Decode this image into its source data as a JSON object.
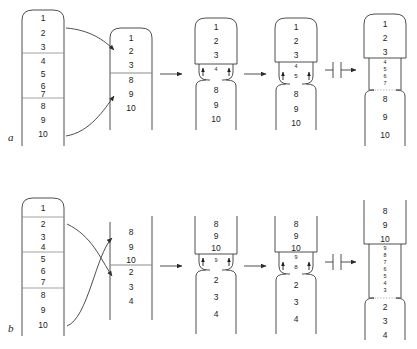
{
  "figure": {
    "type": "diagram",
    "panels": [
      {
        "id": "a",
        "label": "a",
        "process": "deletion",
        "stages": [
          {
            "stage": 1,
            "name": "paired-chromosome-with-segments",
            "shape": "rounded-top-bar",
            "segments": [
              {
                "items": [
                  "1",
                  "2",
                  "3"
                ]
              },
              {
                "items": [
                  "4",
                  "5",
                  "6",
                  "7"
                ]
              },
              {
                "items": [
                  "8",
                  "9",
                  "10"
                ]
              }
            ],
            "dividers_after": [
              "3",
              "7"
            ]
          },
          {
            "stage": 2,
            "name": "looped-chromosome",
            "shape": "rounded-top-bar",
            "segments": [
              {
                "items": [
                  "1",
                  "2",
                  "3"
                ]
              },
              {
                "items": [
                  "8",
                  "9",
                  "10"
                ]
              }
            ],
            "dividers_after": [
              "3"
            ]
          },
          {
            "stage": 3,
            "name": "pinched-junction-single",
            "top_items": [
              "1",
              "2",
              "3"
            ],
            "neck_items": [
              "4"
            ],
            "bottom_items": [
              "8",
              "9",
              "10"
            ],
            "arrows": [
              "up",
              "up"
            ]
          },
          {
            "stage": 4,
            "name": "pinched-junction-double",
            "top_items": [
              "1",
              "2",
              "3"
            ],
            "neck_items": [
              "4",
              "5"
            ],
            "bottom_items": [
              "8",
              "9",
              "10"
            ],
            "arrows": [
              "up",
              "up"
            ]
          },
          {
            "stage": 5,
            "name": "resolved-chromosome",
            "top_items": [
              "1",
              "2",
              "3"
            ],
            "neck_items": [
              "4",
              "5",
              "6",
              "7"
            ],
            "bottom_items": [
              "8",
              "9",
              "10"
            ]
          }
        ],
        "connectors": [
          {
            "type": "curved-arrow",
            "from": "segment-top",
            "to": "stage-2-top"
          },
          {
            "type": "curved-arrow",
            "from": "segment-bottom",
            "to": "stage-2-bottom"
          },
          {
            "type": "straight-arrow",
            "between": "stage-2-to-stage-3"
          },
          {
            "type": "straight-arrow",
            "between": "stage-3-to-stage-4"
          },
          {
            "type": "barred-arrow",
            "between": "stage-4-to-stage-5"
          }
        ]
      },
      {
        "id": "b",
        "label": "b",
        "process": "inversion",
        "stages": [
          {
            "stage": 1,
            "name": "paired-chromosome-with-segments",
            "shape": "rounded-top-bar",
            "segments": [
              {
                "items": [
                  "1"
                ]
              },
              {
                "items": [
                  "2",
                  "3",
                  "4"
                ]
              },
              {
                "items": [
                  "5",
                  "6",
                  "7"
                ]
              },
              {
                "items": [
                  "8",
                  "9",
                  "10"
                ]
              }
            ],
            "dividers_after": [
              "1",
              "4",
              "7"
            ]
          },
          {
            "stage": 2,
            "name": "crossed-chromosome",
            "shape": "flat-bar",
            "segments": [
              {
                "items": [
                  "8",
                  "9",
                  "10"
                ]
              },
              {
                "items": [
                  "2",
                  "3",
                  "4"
                ]
              }
            ],
            "dividers_after": [
              "10"
            ]
          },
          {
            "stage": 3,
            "name": "pinched-junction-single",
            "top_items": [
              "8",
              "9",
              "10"
            ],
            "neck_items": [
              "9"
            ],
            "bottom_items": [
              "2",
              "3",
              "4"
            ],
            "arrows": [
              "up",
              "up"
            ]
          },
          {
            "stage": 4,
            "name": "pinched-junction-double",
            "top_items": [
              "8",
              "9",
              "10"
            ],
            "neck_items": [
              "9",
              "8"
            ],
            "bottom_items": [
              "2",
              "3",
              "4"
            ],
            "arrows": [
              "up",
              "up"
            ]
          },
          {
            "stage": 5,
            "name": "resolved-chromosome",
            "top_items": [
              "8",
              "9",
              "10"
            ],
            "neck_items": [
              "9",
              "8",
              "7",
              "6",
              "5",
              "4",
              "3"
            ],
            "bottom_items": [
              "2",
              "3",
              "4"
            ]
          }
        ],
        "connectors": [
          {
            "type": "curved-arrow-crossing",
            "from": "segment-upper",
            "to": "stage-2-lower"
          },
          {
            "type": "curved-arrow-crossing",
            "from": "segment-lower",
            "to": "stage-2-upper"
          },
          {
            "type": "straight-arrow",
            "between": "stage-2-to-stage-3"
          },
          {
            "type": "straight-arrow",
            "between": "stage-3-to-stage-4"
          },
          {
            "type": "barred-arrow",
            "between": "stage-4-to-stage-5"
          }
        ]
      }
    ],
    "colors": {
      "stroke": "#3a3a3a",
      "divider": "#8c8c8c",
      "text": "#222222",
      "background": "#ffffff"
    }
  }
}
